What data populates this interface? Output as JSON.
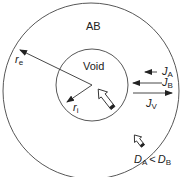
{
  "diagram": {
    "region_outer_label": "AB",
    "region_inner_label": "Void",
    "radius_outer": {
      "symbol": "r",
      "subscript": "e"
    },
    "radius_inner": {
      "symbol": "r",
      "subscript": "i"
    },
    "fluxes": [
      {
        "symbol": "J",
        "subscript": "A",
        "direction": "inward"
      },
      {
        "symbol": "J",
        "subscript": "B",
        "direction": "inward"
      },
      {
        "symbol": "J",
        "subscript": "V",
        "direction": "outward"
      }
    ],
    "condition": {
      "left": "D",
      "left_sub": "A",
      "op": "<",
      "right": "D",
      "right_sub": "B"
    },
    "colors": {
      "stroke": "#333333",
      "background": "#ffffff"
    }
  }
}
